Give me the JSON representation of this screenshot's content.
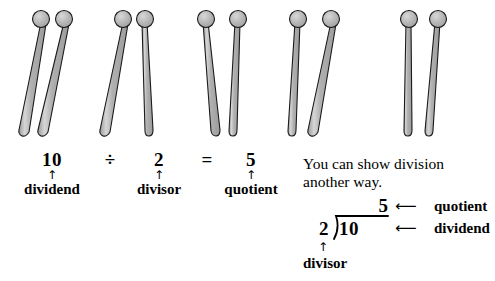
{
  "illustration": {
    "name": "drumsticks-groups",
    "total_sticks": 10,
    "group_count": 5,
    "sticks_per_group": 2,
    "colors": {
      "shaft_fill": "#a9a9a9",
      "shaft_highlight": "#d2d2d2",
      "knob_fill": "#b4b4b4",
      "outline": "#1a1a1a"
    },
    "sticks": [
      {
        "id": "stick-1",
        "top_x": 41,
        "bottom_x": 22
      },
      {
        "id": "stick-2",
        "top_x": 64,
        "bottom_x": 41
      },
      {
        "id": "stick-3",
        "top_x": 123,
        "bottom_x": 103
      },
      {
        "id": "stick-4",
        "top_x": 145,
        "bottom_x": 149
      },
      {
        "id": "stick-5",
        "top_x": 206,
        "bottom_x": 216
      },
      {
        "id": "stick-6",
        "top_x": 238,
        "bottom_x": 233
      },
      {
        "id": "stick-7",
        "top_x": 298,
        "bottom_x": 292
      },
      {
        "id": "stick-8",
        "top_x": 331,
        "bottom_x": 311
      },
      {
        "id": "stick-9",
        "top_x": 409,
        "bottom_x": 409
      },
      {
        "id": "stick-10",
        "top_x": 438,
        "bottom_x": 429
      }
    ]
  },
  "equation": {
    "dividend_value": "10",
    "dividend_label": "dividend",
    "operator_divide": "÷",
    "divisor_value": "2",
    "divisor_label": "divisor",
    "operator_equals": "=",
    "quotient_value": "5",
    "quotient_label": "quotient",
    "arrow_up": "↑"
  },
  "explanation": {
    "line1": "You can show division",
    "line2": "another way."
  },
  "long_division": {
    "quotient": "5",
    "divisor": "2",
    "dividend": "10",
    "arrow_left": "⟵",
    "arrow_up": "↑",
    "quotient_tag": "quotient",
    "dividend_tag": "dividend",
    "divisor_tag": "divisor"
  }
}
